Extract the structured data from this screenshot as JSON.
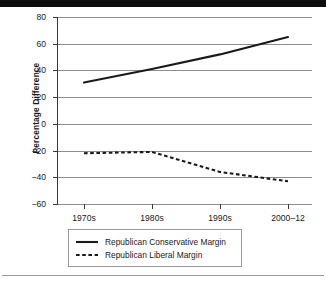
{
  "chart_data": {
    "type": "line",
    "title": "",
    "xlabel": "",
    "ylabel": "Percentage Difference",
    "categories": [
      "1970s",
      "1980s",
      "1990s",
      "2000–12"
    ],
    "ylim": [
      -60,
      80
    ],
    "yticks": [
      80,
      60,
      40,
      20,
      0,
      -20,
      -40,
      -60
    ],
    "ytick_labels": [
      "80",
      "60",
      "40",
      "20",
      "0",
      "−20",
      "−40",
      "−60"
    ],
    "grid": true,
    "legend_position": "below-center",
    "series": [
      {
        "name": "Republican Conservative Margin",
        "style": "solid",
        "color": "#1a1a1a",
        "values": [
          31,
          41,
          52,
          65
        ]
      },
      {
        "name": "Republican Liberal Margin",
        "style": "dashed",
        "color": "#1a1a1a",
        "values": [
          -22,
          -21,
          -36,
          -43
        ]
      }
    ]
  },
  "axes": {
    "y_title": "Percentage Difference",
    "y_tick_0": "80",
    "y_tick_1": "60",
    "y_tick_2": "40",
    "y_tick_3": "20",
    "y_tick_4": "0",
    "y_tick_5": "−20",
    "y_tick_6": "−40",
    "y_tick_7": "−60",
    "x_tick_0": "1970s",
    "x_tick_1": "1980s",
    "x_tick_2": "1990s",
    "x_tick_3": "2000–12"
  },
  "legend": {
    "items": [
      {
        "label": "Republican Conservative Margin",
        "style": "solid"
      },
      {
        "label": "Republican Liberal Margin",
        "style": "dashed"
      }
    ],
    "item_0_label": "Republican Conservative Margin",
    "item_1_label": "Republican Liberal Margin"
  }
}
